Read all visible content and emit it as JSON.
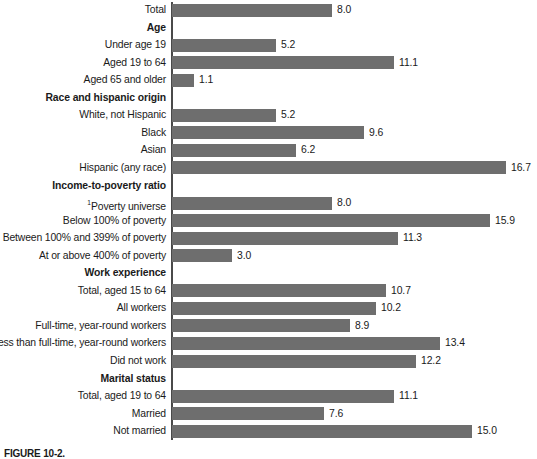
{
  "chart_data": {
    "type": "bar",
    "orientation": "horizontal",
    "title": "",
    "xlabel": "",
    "ylabel": "",
    "grid": false,
    "legend": null,
    "xlim": [
      0,
      18
    ],
    "px_per_unit": 20,
    "value_format": "one-decimal",
    "categories": [
      "Total",
      "Age",
      "Under age 19",
      "Aged 19 to 64",
      "Aged 65 and older",
      "Race and hispanic origin",
      "White, not Hispanic",
      "Black",
      "Asian",
      "Hispanic (any race)",
      "Income-to-poverty ratio",
      "Poverty universe",
      "Below 100% of poverty",
      "Between 100% and 399% of poverty",
      "At or above 400% of poverty",
      "Work experience",
      "Total, aged 15 to 64",
      "All workers",
      "Full-time, year-round workers",
      "Less than full-time, year-round workers",
      "Did not work",
      "Marital status",
      "Total, aged 19 to 64",
      "Married",
      "Not married"
    ],
    "values": [
      8.0,
      null,
      5.2,
      11.1,
      1.1,
      null,
      5.2,
      9.6,
      6.2,
      16.7,
      null,
      8.0,
      15.9,
      11.3,
      3.0,
      null,
      10.7,
      10.2,
      8.9,
      13.4,
      12.2,
      null,
      11.1,
      7.6,
      15.0
    ],
    "rows": [
      {
        "label": "Total",
        "value": 8.0,
        "value_text": "8.0",
        "header": false,
        "footnote": ""
      },
      {
        "label": "Age",
        "value": null,
        "value_text": "",
        "header": true,
        "footnote": ""
      },
      {
        "label": "Under age 19",
        "value": 5.2,
        "value_text": "5.2",
        "header": false,
        "footnote": ""
      },
      {
        "label": "Aged 19 to 64",
        "value": 11.1,
        "value_text": "11.1",
        "header": false,
        "footnote": ""
      },
      {
        "label": "Aged 65 and older",
        "value": 1.1,
        "value_text": "1.1",
        "header": false,
        "footnote": ""
      },
      {
        "label": "Race and hispanic origin",
        "value": null,
        "value_text": "",
        "header": true,
        "footnote": ""
      },
      {
        "label": "White, not Hispanic",
        "value": 5.2,
        "value_text": "5.2",
        "header": false,
        "footnote": ""
      },
      {
        "label": "Black",
        "value": 9.6,
        "value_text": "9.6",
        "header": false,
        "footnote": ""
      },
      {
        "label": "Asian",
        "value": 6.2,
        "value_text": "6.2",
        "header": false,
        "footnote": ""
      },
      {
        "label": "Hispanic (any race)",
        "value": 16.7,
        "value_text": "16.7",
        "header": false,
        "footnote": ""
      },
      {
        "label": "Income-to-poverty ratio",
        "value": null,
        "value_text": "",
        "header": true,
        "footnote": ""
      },
      {
        "label": "Poverty universe",
        "value": 8.0,
        "value_text": "8.0",
        "header": false,
        "footnote": "1"
      },
      {
        "label": "Below 100% of poverty",
        "value": 15.9,
        "value_text": "15.9",
        "header": false,
        "footnote": ""
      },
      {
        "label": "Between 100% and 399% of poverty",
        "value": 11.3,
        "value_text": "11.3",
        "header": false,
        "footnote": ""
      },
      {
        "label": "At or above 400% of poverty",
        "value": 3.0,
        "value_text": "3.0",
        "header": false,
        "footnote": ""
      },
      {
        "label": "Work experience",
        "value": null,
        "value_text": "",
        "header": true,
        "footnote": ""
      },
      {
        "label": "Total, aged 15 to 64",
        "value": 10.7,
        "value_text": "10.7",
        "header": false,
        "footnote": ""
      },
      {
        "label": "All workers",
        "value": 10.2,
        "value_text": "10.2",
        "header": false,
        "footnote": ""
      },
      {
        "label": "Full-time, year-round workers",
        "value": 8.9,
        "value_text": "8.9",
        "header": false,
        "footnote": ""
      },
      {
        "label": "Less than full-time, year-round workers",
        "value": 13.4,
        "value_text": "13.4",
        "header": false,
        "footnote": ""
      },
      {
        "label": "Did not work",
        "value": 12.2,
        "value_text": "12.2",
        "header": false,
        "footnote": ""
      },
      {
        "label": "Marital status",
        "value": null,
        "value_text": "",
        "header": true,
        "footnote": ""
      },
      {
        "label": "Total, aged 19 to 64",
        "value": 11.1,
        "value_text": "11.1",
        "header": false,
        "footnote": ""
      },
      {
        "label": "Married",
        "value": 7.6,
        "value_text": "7.6",
        "header": false,
        "footnote": ""
      },
      {
        "label": "Not married",
        "value": 15.0,
        "value_text": "15.0",
        "header": false,
        "footnote": ""
      }
    ]
  },
  "colors": {
    "bar": "#6e6e6e",
    "axis": "#4a4a4a",
    "text": "#1a1a1a",
    "background": "#ffffff"
  },
  "caption": {
    "label": "FIGURE 10-2.",
    "text": ""
  }
}
